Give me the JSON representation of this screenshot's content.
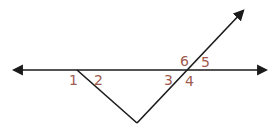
{
  "diagram": {
    "type": "geometry-angles",
    "colors": {
      "line": "#1a1a1a",
      "label": "#a05a4e",
      "background": "#ffffff"
    },
    "lines": [
      {
        "name": "horizontal-line",
        "from": [
          14,
          70
        ],
        "to": [
          268,
          70
        ],
        "arrows": "both"
      },
      {
        "name": "left-transversal",
        "from": [
          77,
          70
        ],
        "to": [
          137,
          123
        ],
        "arrows": "none"
      },
      {
        "name": "right-transversal",
        "from": [
          137,
          123
        ],
        "to": [
          244,
          10
        ],
        "arrows": "end"
      }
    ],
    "angle_labels": [
      {
        "id": "1",
        "text": "1",
        "x": 69,
        "y": 85
      },
      {
        "id": "2",
        "text": "2",
        "x": 94,
        "y": 85
      },
      {
        "id": "3",
        "text": "3",
        "x": 164,
        "y": 85
      },
      {
        "id": "4",
        "text": "4",
        "x": 185,
        "y": 86
      },
      {
        "id": "6",
        "text": "6",
        "x": 180,
        "y": 66
      },
      {
        "id": "5",
        "text": "5",
        "x": 201,
        "y": 67
      }
    ]
  }
}
